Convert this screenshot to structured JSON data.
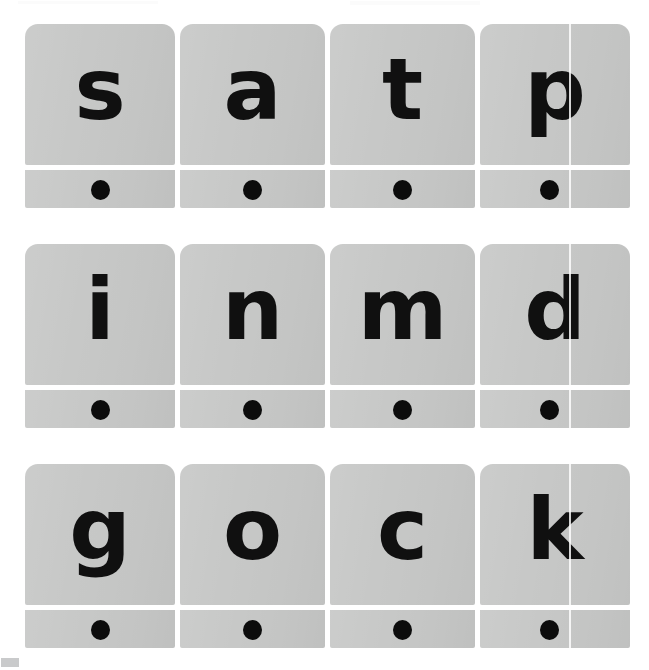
{
  "document": {
    "title": "Phonics Letter Sound Cards",
    "background_color": "#ffffff",
    "card_color": "#c7c8c7",
    "letter_color": "#101010",
    "dot_color": "#0c0c0c",
    "rows": 3,
    "columns": 4,
    "total_cards": 12
  },
  "cards": [
    {
      "letter": "s",
      "row": 1,
      "column": 1,
      "sound_dots": 1,
      "dot_label": "sound-dot"
    },
    {
      "letter": "a",
      "row": 1,
      "column": 2,
      "sound_dots": 1,
      "dot_label": "sound-dot"
    },
    {
      "letter": "t",
      "row": 1,
      "column": 3,
      "sound_dots": 1,
      "dot_label": "sound-dot"
    },
    {
      "letter": "p",
      "row": 1,
      "column": 4,
      "sound_dots": 1,
      "dot_label": "sound-dot"
    },
    {
      "letter": "i",
      "row": 2,
      "column": 1,
      "sound_dots": 1,
      "dot_label": "sound-dot"
    },
    {
      "letter": "n",
      "row": 2,
      "column": 2,
      "sound_dots": 1,
      "dot_label": "sound-dot"
    },
    {
      "letter": "m",
      "row": 2,
      "column": 3,
      "sound_dots": 1,
      "dot_label": "sound-dot"
    },
    {
      "letter": "d",
      "row": 2,
      "column": 4,
      "sound_dots": 1,
      "dot_label": "sound-dot"
    },
    {
      "letter": "g",
      "row": 3,
      "column": 1,
      "sound_dots": 1,
      "dot_label": "sound-dot"
    },
    {
      "letter": "o",
      "row": 3,
      "column": 2,
      "sound_dots": 1,
      "dot_label": "sound-dot"
    },
    {
      "letter": "c",
      "row": 3,
      "column": 3,
      "sound_dots": 1,
      "dot_label": "sound-dot"
    },
    {
      "letter": "k",
      "row": 3,
      "column": 4,
      "sound_dots": 1,
      "dot_label": "sound-dot"
    }
  ],
  "rows_text": {
    "row1": "s a t p",
    "row2": "i n m d",
    "row3": "g o c k"
  },
  "artifacts": {
    "column4_seam": "faint vertical white scan seam through column 4",
    "corner_swatch": "small gray swatch at bottom-left margin"
  }
}
